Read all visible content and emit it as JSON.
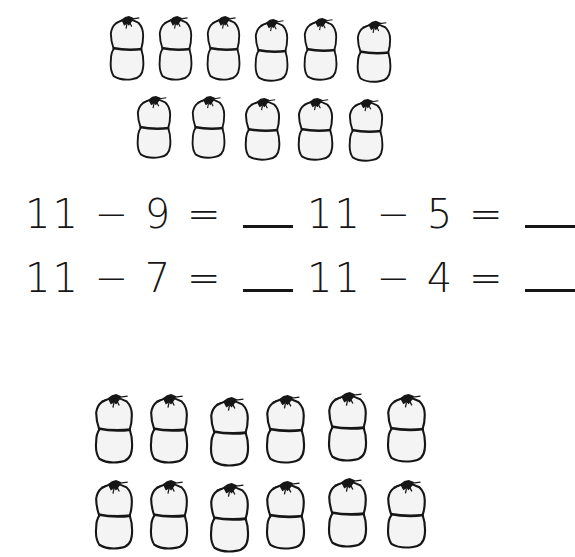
{
  "worksheet": {
    "top_group": {
      "count": 11,
      "rows": [
        {
          "bags": [
            {
              "x": 108,
              "y": 14,
              "w": 38,
              "h": 68
            },
            {
              "x": 157,
              "y": 14,
              "w": 37,
              "h": 68
            },
            {
              "x": 205,
              "y": 14,
              "w": 37,
              "h": 68
            },
            {
              "x": 253,
              "y": 17,
              "w": 37,
              "h": 66
            },
            {
              "x": 302,
              "y": 16,
              "w": 37,
              "h": 66
            },
            {
              "x": 355,
              "y": 19,
              "w": 38,
              "h": 65
            }
          ]
        },
        {
          "bags": [
            {
              "x": 135,
              "y": 94,
              "w": 38,
              "h": 66
            },
            {
              "x": 190,
              "y": 94,
              "w": 37,
              "h": 66
            },
            {
              "x": 243,
              "y": 96,
              "w": 39,
              "h": 66
            },
            {
              "x": 296,
              "y": 96,
              "w": 39,
              "h": 66
            },
            {
              "x": 347,
              "y": 97,
              "w": 38,
              "h": 66
            }
          ]
        }
      ]
    },
    "equations": [
      {
        "minuend": "11",
        "operator": "−",
        "subtrahend": "9",
        "equals": "=",
        "answer": "",
        "x": 25,
        "y": 193
      },
      {
        "minuend": "11",
        "operator": "−",
        "subtrahend": "5",
        "equals": "=",
        "answer": "",
        "x": 307,
        "y": 193
      },
      {
        "minuend": "11",
        "operator": "−",
        "subtrahend": "7",
        "equals": "=",
        "answer": "",
        "x": 25,
        "y": 257
      },
      {
        "minuend": "11",
        "operator": "−",
        "subtrahend": "4",
        "equals": "=",
        "answer": "",
        "x": 307,
        "y": 257
      }
    ],
    "bottom_group": {
      "rows": [
        {
          "bags": [
            {
              "x": 93,
              "y": 392,
              "w": 42,
              "h": 73
            },
            {
              "x": 148,
              "y": 392,
              "w": 42,
              "h": 73
            },
            {
              "x": 208,
              "y": 395,
              "w": 43,
              "h": 73
            },
            {
              "x": 264,
              "y": 393,
              "w": 43,
              "h": 72
            },
            {
              "x": 326,
              "y": 390,
              "w": 43,
              "h": 73
            },
            {
              "x": 385,
              "y": 392,
              "w": 43,
              "h": 72
            }
          ]
        },
        {
          "bags": [
            {
              "x": 93,
              "y": 478,
              "w": 42,
              "h": 73
            },
            {
              "x": 148,
              "y": 478,
              "w": 42,
              "h": 73
            },
            {
              "x": 208,
              "y": 481,
              "w": 43,
              "h": 73
            },
            {
              "x": 264,
              "y": 479,
              "w": 43,
              "h": 72
            },
            {
              "x": 326,
              "y": 476,
              "w": 43,
              "h": 73
            },
            {
              "x": 385,
              "y": 478,
              "w": 43,
              "h": 72
            }
          ]
        }
      ]
    },
    "colors": {
      "ink": "#161616",
      "bag_fill": "#f4f4f4",
      "background": "#ffffff"
    }
  }
}
